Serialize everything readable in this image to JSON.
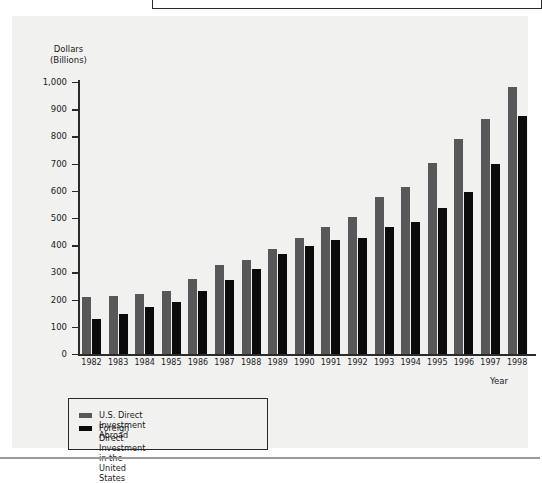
{
  "figure": {
    "y_axis_title": "Dollars\n(Billions)",
    "x_axis_title": "Year"
  },
  "legend": {
    "items": [
      {
        "label": "U.S. Direct Investment Abroad",
        "color": "#58585a",
        "swatch_name": "legend-swatch-gray"
      },
      {
        "label": "Foreign Direct Investment\nin the United States",
        "color": "#0b0b0b",
        "swatch_name": "legend-swatch-black"
      }
    ]
  },
  "chart_data": {
    "type": "bar",
    "title": "",
    "xlabel": "Year",
    "ylabel": "Dollars (Billions)",
    "ylim": [
      0,
      1000
    ],
    "yticks": [
      0,
      100,
      200,
      300,
      400,
      500,
      600,
      700,
      800,
      900,
      1000
    ],
    "ytick_labels": [
      "0",
      "100",
      "200",
      "300",
      "400",
      "500",
      "600",
      "700",
      "800",
      "900",
      "1,000"
    ],
    "grid": false,
    "legend_position": "bottom-left",
    "categories": [
      "1982",
      "1983",
      "1984",
      "1985",
      "1986",
      "1987",
      "1988",
      "1989",
      "1990",
      "1991",
      "1992",
      "1993",
      "1994",
      "1995",
      "1996",
      "1997",
      "1998"
    ],
    "series": [
      {
        "name": "U.S. Direct Investment Abroad",
        "color": "#58585a",
        "values": [
          210,
          215,
          222,
          233,
          277,
          326,
          347,
          385,
          428,
          467,
          503,
          576,
          613,
          702,
          789,
          865,
          981
        ]
      },
      {
        "name": "Foreign Direct Investment in the United States",
        "color": "#0b0b0b",
        "values": [
          130,
          147,
          172,
          192,
          230,
          272,
          312,
          368,
          396,
          419,
          428,
          467,
          487,
          535,
          595,
          697,
          875
        ]
      }
    ]
  }
}
